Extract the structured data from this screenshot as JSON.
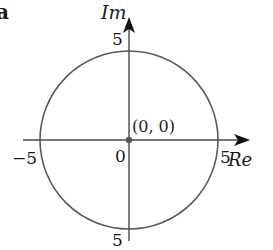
{
  "figure": {
    "panel_label": "a",
    "axes": {
      "vertical_label": "Im",
      "horizontal_label": "Re",
      "ticks": {
        "y_positive": "5",
        "y_negative": "5",
        "x_positive": "5",
        "x_negative": "−5",
        "origin": "0"
      }
    },
    "origin_point_label": "(0, 0)",
    "circle": {
      "center": [
        0,
        0
      ],
      "radius": 5
    },
    "colors": {
      "circle_stroke": "#5a5a5a",
      "axis_stroke": "#4a4a4a",
      "arrow_fill": "#111111",
      "point_fill": "#555555",
      "text": "#1a1a1a"
    }
  }
}
